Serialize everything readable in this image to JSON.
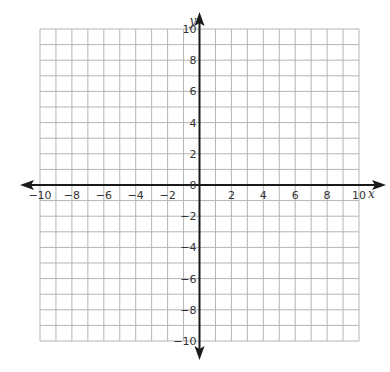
{
  "chart_data": {
    "type": "scatter",
    "title": "",
    "xlabel": "x",
    "ylabel": "y",
    "xlim": [
      -10,
      10
    ],
    "ylim": [
      -10,
      10
    ],
    "grid": true,
    "grid_step": 1,
    "x_ticks": [
      -10,
      -8,
      -6,
      -4,
      -2,
      2,
      4,
      6,
      8,
      10
    ],
    "x_tick_labels": [
      "−10",
      "−8",
      "−6",
      "−4",
      "−2",
      "2",
      "4",
      "6",
      "8",
      "10"
    ],
    "y_ticks": [
      10,
      8,
      6,
      4,
      2,
      -2,
      -4,
      -6,
      -8,
      -10
    ],
    "y_tick_labels": [
      "10",
      "8",
      "6",
      "4",
      "2",
      "−2",
      "−4",
      "−6",
      "−8",
      "−10"
    ],
    "origin_label": "0",
    "series": [],
    "legend": null
  },
  "colors": {
    "grid": "#b5b5b5",
    "axis": "#1a1a1a",
    "text": "#333333",
    "background": "#ffffff"
  }
}
